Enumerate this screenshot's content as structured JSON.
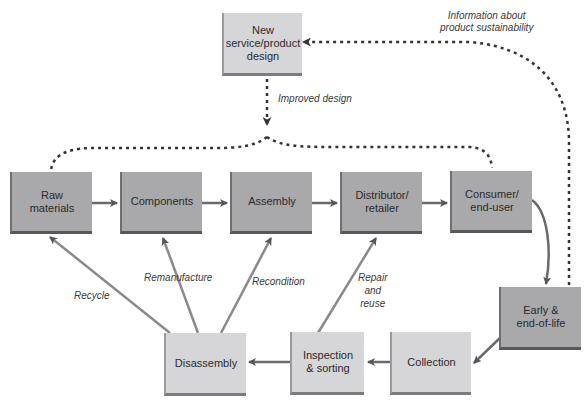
{
  "diagram": {
    "type": "circular economy product lifecycle flow",
    "nodes": {
      "new_design": "New service/product design",
      "raw_materials": "Raw materials",
      "components": "Components",
      "assembly": "Assembly",
      "distributor": "Distributor/ retailer",
      "consumer": "Consumer/ end-user",
      "end_of_life": "Early & end-of-life",
      "collection": "Collection",
      "inspection": "Inspection & sorting",
      "disassembly": "Disassembly"
    },
    "node_lines": {
      "new_design": [
        "New",
        "service/product",
        "design"
      ],
      "raw_materials": [
        "Raw",
        "materials"
      ],
      "components": [
        "Components"
      ],
      "assembly": [
        "Assembly"
      ],
      "distributor": [
        "Distributor/",
        "retailer"
      ],
      "consumer": [
        "Consumer/",
        "end-user"
      ],
      "end_of_life": [
        "Early &",
        "end-of-life"
      ],
      "collection": [
        "Collection"
      ],
      "inspection": [
        "Inspection",
        "& sorting"
      ],
      "disassembly": [
        "Disassembly"
      ]
    },
    "labels": {
      "info": [
        "Information about",
        "product sustainability"
      ],
      "improved": "Improved design",
      "recycle": "Recycle",
      "remanufacture": "Remanufacture",
      "recondition": "Recondition",
      "repair": [
        "Repair",
        "and",
        "reuse"
      ]
    },
    "edges": [
      {
        "from": "raw_materials",
        "to": "components",
        "style": "solid"
      },
      {
        "from": "components",
        "to": "assembly",
        "style": "solid"
      },
      {
        "from": "assembly",
        "to": "distributor",
        "style": "solid"
      },
      {
        "from": "distributor",
        "to": "consumer",
        "style": "solid"
      },
      {
        "from": "consumer",
        "to": "end_of_life",
        "style": "solid-curved"
      },
      {
        "from": "end_of_life",
        "to": "collection",
        "style": "solid"
      },
      {
        "from": "collection",
        "to": "inspection",
        "style": "solid"
      },
      {
        "from": "inspection",
        "to": "disassembly",
        "style": "solid"
      },
      {
        "from": "inspection",
        "to": "distributor",
        "label": "Repair and reuse",
        "style": "solid"
      },
      {
        "from": "disassembly",
        "to": "assembly",
        "label": "Recondition",
        "style": "solid"
      },
      {
        "from": "disassembly",
        "to": "components",
        "label": "Remanufacture",
        "style": "solid"
      },
      {
        "from": "disassembly",
        "to": "raw_materials",
        "label": "Recycle",
        "style": "solid"
      },
      {
        "from": "end_of_life",
        "to": "new_design",
        "label": "Information about product sustainability",
        "style": "dotted"
      },
      {
        "from": "new_design",
        "to": "raw_materials/consumer",
        "label": "Improved design",
        "style": "dotted"
      }
    ],
    "colors": {
      "dark_box": "#a9a9ab",
      "light_box": "#d6d6d8",
      "arrow": "#5a5a5e",
      "dotted": "#3a3a3a"
    }
  }
}
